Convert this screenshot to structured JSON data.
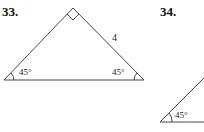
{
  "problems": [
    {
      "number": "33.",
      "shape": "right-isosceles-triangle",
      "side_label": "4",
      "angles": [
        "45°",
        "45°"
      ],
      "right_angle_marker": true
    },
    {
      "number": "34.",
      "shape": "right-triangle-partial",
      "angles": [
        "45°"
      ]
    }
  ],
  "colors": {
    "stroke": "#333333",
    "background": "#ffffff"
  }
}
